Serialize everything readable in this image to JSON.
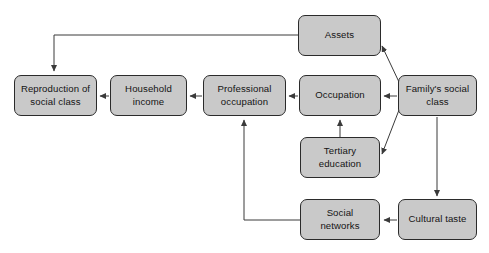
{
  "diagram": {
    "colors": {
      "node_fill": "#c9c9c9",
      "node_border": "#2b2b2b",
      "text": "#141414",
      "arrow": "#3a3a3a",
      "background": "#ffffff"
    },
    "nodes": [
      {
        "id": "assets",
        "label": "Assets",
        "x": 298,
        "y": 15,
        "w": 83,
        "h": 41
      },
      {
        "id": "reproduction",
        "label": "Reproduction of\nsocial class",
        "x": 14,
        "y": 75,
        "w": 83,
        "h": 41
      },
      {
        "id": "household",
        "label": "Household\nincome",
        "x": 110,
        "y": 75,
        "w": 77,
        "h": 41
      },
      {
        "id": "professional",
        "label": "Professional\noccupation",
        "x": 203,
        "y": 75,
        "w": 83,
        "h": 41
      },
      {
        "id": "occupation",
        "label": "Occupation",
        "x": 299,
        "y": 75,
        "w": 82,
        "h": 41
      },
      {
        "id": "family",
        "label": "Family's social\nclass",
        "x": 398,
        "y": 75,
        "w": 79,
        "h": 41
      },
      {
        "id": "tertiary",
        "label": "Tertiary\neducation",
        "x": 300,
        "y": 137,
        "w": 80,
        "h": 41
      },
      {
        "id": "social",
        "label": "Social\nnetworks",
        "x": 300,
        "y": 199,
        "w": 80,
        "h": 41
      },
      {
        "id": "cultural",
        "label": "Cultural taste",
        "x": 398,
        "y": 199,
        "w": 79,
        "h": 41
      }
    ],
    "edges": [
      {
        "id": "family-to-assets",
        "from": "family",
        "to": "assets",
        "path": "M 399 82 L 382 46"
      },
      {
        "id": "family-to-occupation",
        "from": "family",
        "to": "occupation",
        "path": "M 397 96 L 384 96"
      },
      {
        "id": "family-to-tertiary",
        "from": "family",
        "to": "tertiary",
        "path": "M 399 110 L 382 154"
      },
      {
        "id": "family-to-cultural",
        "from": "family",
        "to": "cultural",
        "path": "M 437 117 L 437 196"
      },
      {
        "id": "assets-to-reproduction",
        "from": "assets",
        "to": "reproduction",
        "path": "M 298 35 L 54 35 L 54 71"
      },
      {
        "id": "occupation-to-professional",
        "from": "occupation",
        "to": "professional",
        "path": "M 298 96 L 289 96"
      },
      {
        "id": "professional-to-household",
        "from": "professional",
        "to": "household",
        "path": "M 202 96 L 190 96"
      },
      {
        "id": "household-to-reproduction",
        "from": "household",
        "to": "reproduction",
        "path": "M 109 96 L 100 96"
      },
      {
        "id": "tertiary-to-occupation",
        "from": "tertiary",
        "to": "occupation",
        "path": "M 340 137 L 340 120"
      },
      {
        "id": "cultural-to-social",
        "from": "cultural",
        "to": "social",
        "path": "M 397 220 L 384 220"
      },
      {
        "id": "social-to-professional",
        "from": "social",
        "to": "professional",
        "path": "M 300 220 L 244 220 L 244 120"
      }
    ]
  }
}
